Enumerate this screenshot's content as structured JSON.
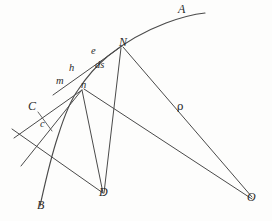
{
  "figure": {
    "background_color": "#fdfdfc",
    "stroke_color": "#4a4a4a",
    "label_color": "#2b2b2b",
    "width": 272,
    "height": 221
  },
  "labels": {
    "A": "A",
    "B": "B",
    "C": "C",
    "N": "N",
    "D": "D",
    "O": "O",
    "e": "e",
    "h": "h",
    "m": "m",
    "n": "n",
    "c": "c",
    "ds": "ds",
    "rho": "ρ"
  },
  "points": [
    {
      "name": "A",
      "label": "A",
      "x": 208,
      "y": 14,
      "kind": "curve-endpoint"
    },
    {
      "name": "B",
      "label": "B",
      "x": 41,
      "y": 207,
      "kind": "curve-endpoint"
    },
    {
      "name": "N",
      "label": "N",
      "x": 122,
      "y": 46,
      "kind": "curve-point"
    },
    {
      "name": "e",
      "label": "e",
      "x": 94,
      "y": 57,
      "kind": "curve-point"
    },
    {
      "name": "h",
      "label": "h",
      "x": 76,
      "y": 73,
      "kind": "curve-point"
    },
    {
      "name": "m",
      "label": "m",
      "x": 62,
      "y": 85,
      "kind": "curve-point"
    },
    {
      "name": "n",
      "label": "n",
      "x": 86,
      "y": 88,
      "kind": "vertex"
    },
    {
      "name": "c",
      "label": "c",
      "x": 48,
      "y": 128,
      "kind": "intersection"
    },
    {
      "name": "C",
      "label": "C",
      "x": 36,
      "y": 110,
      "kind": "line-point"
    },
    {
      "name": "D",
      "label": "D",
      "x": 104,
      "y": 196,
      "kind": "vertex"
    },
    {
      "name": "O",
      "label": "O",
      "x": 253,
      "y": 199,
      "kind": "center-of-curvature"
    },
    {
      "name": "ds",
      "label": "ds",
      "x": 100,
      "y": 71,
      "kind": "arc-element-label"
    },
    {
      "name": "rho",
      "label": "ρ",
      "x": 190,
      "y": 111,
      "kind": "radius-label"
    }
  ],
  "label_positions": {
    "A": {
      "x": 178,
      "y": 3
    },
    "N": {
      "x": 119,
      "y": 38
    },
    "e": {
      "x": 91,
      "y": 49
    },
    "ds": {
      "x": 95,
      "y": 62
    },
    "h": {
      "x": 70,
      "y": 66
    },
    "m": {
      "x": 58,
      "y": 76
    },
    "n": {
      "x": 81,
      "y": 80
    },
    "C": {
      "x": 29,
      "y": 101
    },
    "c": {
      "x": 41,
      "y": 119
    },
    "rho": {
      "x": 177,
      "y": 102
    },
    "D": {
      "x": 99,
      "y": 186
    },
    "B": {
      "x": 37,
      "y": 200
    },
    "O": {
      "x": 247,
      "y": 192
    }
  },
  "elements": {
    "curve_AB": "main curve from B through c, m, h, e, N to A",
    "tangent_line": "tangent through m, h, e touching at N region",
    "normal_N_O": "radius of curvature rho from N to O",
    "normal_n_O": "radius from n through to O",
    "chord_N_D": "line from N to D",
    "chord_n_D": "line from n to D",
    "ray_n_C": "ray from n through C to lower left",
    "ray_n_lower": "ray from n to lower left",
    "ray_D_upper": "ray from D upward left through c"
  }
}
